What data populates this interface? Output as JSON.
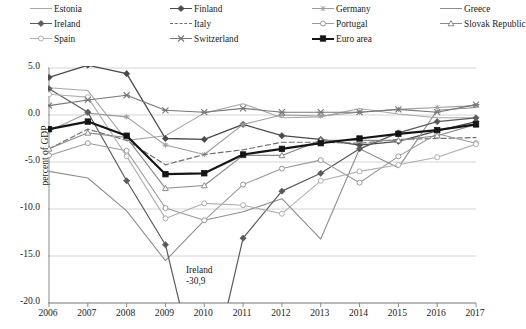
{
  "chart_data": {
    "type": "line",
    "title": "",
    "xlabel": "",
    "ylabel": "percent of GDP",
    "x": [
      2006,
      2007,
      2008,
      2009,
      2010,
      2011,
      2012,
      2013,
      2014,
      2015,
      2016,
      2017
    ],
    "xticklabels": [
      "2006",
      "2007",
      "2008",
      "2009",
      "2010",
      "2011",
      "2012",
      "2013",
      "2014",
      "2015",
      "2016",
      "2017"
    ],
    "yticklabels": [
      "5.0",
      "0.0",
      "-5.0",
      "-10.0",
      "-15.0",
      "-20.0"
    ],
    "yticks": [
      5.0,
      0.0,
      -5.0,
      -10.0,
      -15.0,
      -20.0
    ],
    "ylim": [
      -20.0,
      5.0
    ],
    "grid": true,
    "legend_position": "top",
    "annotations": [
      {
        "text_line1": "Ireland",
        "text_line2": "-30,9",
        "x": 2010,
        "y": -30.9
      }
    ],
    "series": [
      {
        "name": "Estonia",
        "color": "#a8a8a8",
        "marker": "none",
        "dash": "none",
        "width": 1.1,
        "values": [
          2.9,
          2.6,
          -2.7,
          -2.2,
          0.2,
          1.2,
          -0.3,
          -0.2,
          0.7,
          0.1,
          -0.3,
          -0.3
        ]
      },
      {
        "name": "Finland",
        "color": "#4a4a4a",
        "marker": "diamond",
        "dash": "none",
        "width": 1.3,
        "values": [
          4.0,
          5.3,
          4.4,
          -2.5,
          -2.6,
          -1.0,
          -2.2,
          -2.6,
          -3.2,
          -2.8,
          -1.7,
          -0.7
        ]
      },
      {
        "name": "Germany",
        "color": "#9c9c9c",
        "marker": "star",
        "dash": "none",
        "width": 1.1,
        "values": [
          -1.7,
          0.2,
          -0.2,
          -3.2,
          -4.2,
          -1.0,
          0.0,
          -0.1,
          0.3,
          0.6,
          0.8,
          1.0
        ]
      },
      {
        "name": "Greece",
        "color": "#8e8e8e",
        "marker": "none",
        "dash": "none",
        "width": 1.1,
        "values": [
          -6.0,
          -6.7,
          -10.2,
          -15.5,
          -11.2,
          -10.3,
          -8.9,
          -13.2,
          -3.6,
          -5.6,
          0.5,
          0.8
        ]
      },
      {
        "name": "Ireland",
        "color": "#5a5a5a",
        "marker": "diamond",
        "dash": "none",
        "width": 1.2,
        "values": [
          2.8,
          0.3,
          -7.0,
          -13.8,
          -30.9,
          -13.1,
          -8.1,
          -6.2,
          -3.6,
          -1.9,
          -0.7,
          -0.3
        ]
      },
      {
        "name": "Italy",
        "color": "#707070",
        "marker": "none",
        "dash": "dashed",
        "width": 1.2,
        "values": [
          -3.6,
          -1.5,
          -2.7,
          -5.3,
          -4.2,
          -3.7,
          -2.9,
          -2.9,
          -3.0,
          -2.6,
          -2.5,
          -2.4
        ]
      },
      {
        "name": "Portugal",
        "color": "#9a9a9a",
        "marker": "circle-open",
        "dash": "none",
        "width": 1.1,
        "values": [
          -4.3,
          -3.0,
          -3.8,
          -9.9,
          -11.2,
          -7.4,
          -5.7,
          -4.8,
          -7.2,
          -4.4,
          -2.0,
          -3.0
        ]
      },
      {
        "name": "Slovak Republic",
        "color": "#8a8a8a",
        "marker": "triangle-open",
        "dash": "none",
        "width": 1.1,
        "values": [
          -3.6,
          -1.9,
          -2.4,
          -7.8,
          -7.5,
          -4.3,
          -4.3,
          -2.7,
          -2.7,
          -2.7,
          -2.2,
          -1.0
        ]
      },
      {
        "name": "Spain",
        "color": "#b0b0b0",
        "marker": "circle-open",
        "dash": "none",
        "width": 1.1,
        "values": [
          2.2,
          1.9,
          -4.4,
          -11.0,
          -9.4,
          -9.6,
          -10.5,
          -7.0,
          -6.0,
          -5.3,
          -4.5,
          -3.1
        ]
      },
      {
        "name": "Switzerland",
        "color": "#777777",
        "marker": "cross-x",
        "dash": "none",
        "width": 1.1,
        "values": [
          1.0,
          1.6,
          2.1,
          0.5,
          0.3,
          0.7,
          0.3,
          0.3,
          0.3,
          0.6,
          0.3,
          1.1
        ]
      },
      {
        "name": "Euro area",
        "color": "#151515",
        "marker": "square",
        "dash": "none",
        "width": 2.2,
        "values": [
          -1.5,
          -0.7,
          -2.2,
          -6.3,
          -6.2,
          -4.2,
          -3.6,
          -3.0,
          -2.5,
          -2.0,
          -1.6,
          -1.0
        ]
      }
    ]
  },
  "legend": {
    "items": [
      {
        "label": "Estonia"
      },
      {
        "label": "Finland"
      },
      {
        "label": "Germany"
      },
      {
        "label": "Greece"
      },
      {
        "label": "Ireland"
      },
      {
        "label": "Italy"
      },
      {
        "label": "Portugal"
      },
      {
        "label": "Slovak Republic"
      },
      {
        "label": "Spain"
      },
      {
        "label": "Switzerland"
      },
      {
        "label": "Euro area"
      }
    ]
  }
}
